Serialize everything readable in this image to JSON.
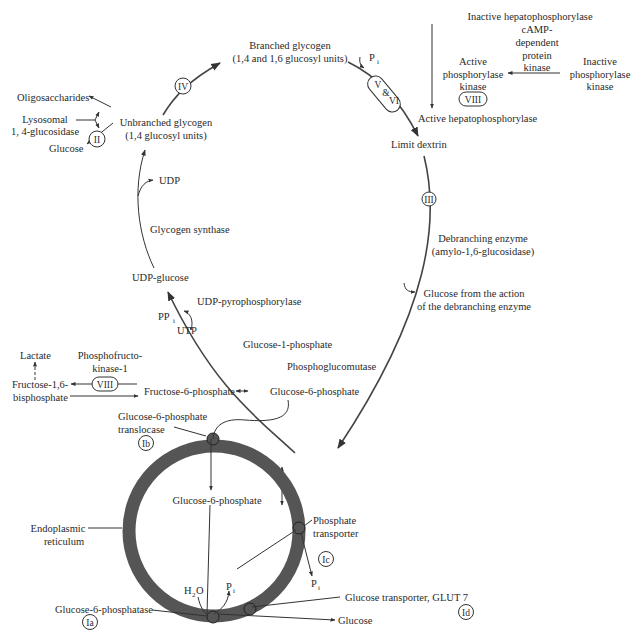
{
  "diagram": {
    "type": "metabolic-pathway",
    "nodes": {
      "branched_glycogen": [
        "Branched glycogen",
        "(1,4 and 1,6 glucosyl units)"
      ],
      "unbranched_glycogen": [
        "Unbranched glycogen",
        "(1,4 glucosyl units)"
      ],
      "oligosaccharides": "Oligosaccharides",
      "lysosomal": [
        "Lysosomal",
        "1, 4-glucosidase"
      ],
      "glucose_lysosome": "Glucose",
      "udp": "UDP",
      "glycogen_synthase": "Glycogen synthase",
      "udp_glucose": "UDP-glucose",
      "udp_pyrophosphorylase": "UDP-pyrophosphorylase",
      "ppi": "PP",
      "ppi_sub": "i",
      "utp": "UTP",
      "glucose_1_phosphate": "Glucose-1-phosphate",
      "phosphoglucomutase": "Phosphoglucomutase",
      "glucose_6_phosphate": "Glucose-6-phosphate",
      "fructose_6_phosphate": "Fructose-6-phosphate",
      "fructose_bisphosphate": [
        "Fructose-1,6-",
        "bisphosphate"
      ],
      "lactate": "Lactate",
      "pfk": [
        "Phosphofructo-",
        "kinase-1"
      ],
      "pi_top": "P",
      "pi_sub": "i",
      "limit_dextrin": "Limit dextrin",
      "debranching_enzyme": [
        "Debranching enzyme",
        "(amylo-1,6-glucosidase)"
      ],
      "glucose_debranching": [
        "Glucose from the action",
        "of the debranching enzyme"
      ],
      "inactive_hepatophosphorylase": "Inactive hepatophosphorylase",
      "active_hepatophosphorylase": "Active hepatophosphorylase",
      "camp_kinase": [
        "cAMP-",
        "dependent",
        "protein",
        "kinase"
      ],
      "active_phosphorylase_kinase": [
        "Active",
        "phosphorylase",
        "kinase"
      ],
      "inactive_phosphorylase_kinase": [
        "Inactive",
        "phosphorylase",
        "kinase"
      ],
      "g6p_translocase": [
        "Glucose-6-phosphate",
        "translocase"
      ],
      "g6p_inner": "Glucose-6-phosphate",
      "endoplasmic_reticulum": [
        "Endoplasmic",
        "reticulum"
      ],
      "phosphate_transporter": [
        "Phosphate",
        "transporter"
      ],
      "h2o": "H",
      "h2o_sub": "2",
      "h2o_o": "O",
      "g6pase": "Glucose-6-phosphatase",
      "glucose_transporter": "Glucose transporter, GLUT 7",
      "glucose_out": "Glucose"
    },
    "badges": {
      "II": "II",
      "III": "III",
      "IV": "IV",
      "V": "V",
      "amp": "&",
      "VI": "VI",
      "VIII_kinase": "VIII",
      "VIII_pfk": "VIII",
      "Ia": "Ia",
      "Ib": "Ib",
      "Ic": "Ic",
      "Id": "Id"
    },
    "colors": {
      "text": "#2a2a2a",
      "line": "#333333",
      "er_membrane": "#555555",
      "background": "#ffffff"
    }
  }
}
